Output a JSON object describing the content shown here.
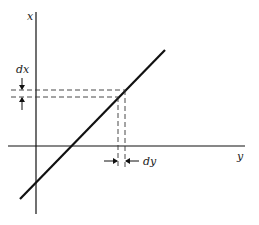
{
  "diagram": {
    "axes": {
      "vertical_label": "x",
      "horizontal_label": "y"
    },
    "annotations": {
      "dx_label": "dx",
      "dy_label": "dy"
    },
    "colors": {
      "line": "#111111",
      "dashed": "#333333"
    }
  }
}
